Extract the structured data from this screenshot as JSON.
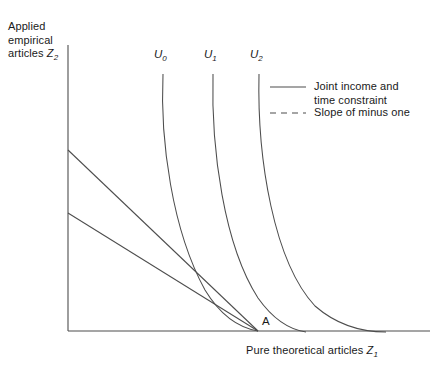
{
  "chart_data": {
    "type": "line",
    "title": "",
    "xlabel": "Pure theoretical articles Z1",
    "ylabel": "Applied empirical articles Z2",
    "xlabel_main": "Pure theoretical articles ",
    "xlabel_var": "Z",
    "xlabel_sub": "1",
    "ylabel_line1": "Applied",
    "ylabel_line2": "empirical",
    "ylabel_line3": "articles ",
    "ylabel_var": "Z",
    "ylabel_sub": "2",
    "grid": false,
    "axis_ticks": false,
    "legend_position": "upper-right",
    "annotations": [
      {
        "name": "point-a",
        "label": "A",
        "x_px": 262,
        "y_px": 315,
        "description": "Tangency / convergence point on the horizontal axis"
      }
    ],
    "indifference_curves": [
      {
        "name": "U0",
        "label": "U",
        "subscript": "0",
        "label_x_px": 154,
        "label_y_px": 48,
        "path": "M 163,74 C 160,140 172,230 205,290 C 222,318 240,328 258,331",
        "description": "Lowest indifference curve, passes through point A"
      },
      {
        "name": "U1",
        "label": "U",
        "subscript": "1",
        "label_x_px": 204,
        "label_y_px": 48,
        "path": "M 213,74 C 211,150 224,245 258,298 C 275,322 292,330 306,332",
        "description": "Middle indifference curve"
      },
      {
        "name": "U2",
        "label": "U",
        "subscript": "2",
        "label_x_px": 250,
        "label_y_px": 48,
        "path": "M 259,74 C 257,160 274,262 315,306 C 338,326 365,332 386,332",
        "description": "Highest indifference curve"
      }
    ],
    "constraint_lines": [
      {
        "name": "joint-income-time-constraint-upper",
        "style": "solid",
        "x1_px": 68,
        "y1_px": 150,
        "x2_px": 258,
        "y2_px": 331
      },
      {
        "name": "slope-of-minus-one-line",
        "style": "solid",
        "x1_px": 68,
        "y1_px": 213,
        "x2_px": 258,
        "y2_px": 331
      }
    ],
    "axes": {
      "y_axis": {
        "x_px": 68,
        "y_top_px": 45,
        "y_bottom_px": 331
      },
      "x_axis": {
        "y_px": 331,
        "x_left_px": 68,
        "x_right_px": 430
      }
    },
    "legend": {
      "entries": [
        {
          "name": "legend-joint-income",
          "style": "solid",
          "line_x1_px": 270,
          "line_x2_px": 306,
          "line_y_px": 87,
          "text_line1": "Joint income and",
          "text_line2": "time constraint",
          "text_x_px": 314,
          "text_y_px": 80
        },
        {
          "name": "legend-slope-minus-one",
          "style": "dashed",
          "line_x1_px": 270,
          "line_x2_px": 306,
          "line_y_px": 113,
          "text_line1": "Slope of minus one",
          "text_line2": "",
          "text_x_px": 314,
          "text_y_px": 106
        }
      ]
    },
    "colors": {
      "background": "#ffffff",
      "line": "#4d4d4d",
      "axis": "#4d4d4d",
      "text": "#1a1a1a"
    }
  }
}
